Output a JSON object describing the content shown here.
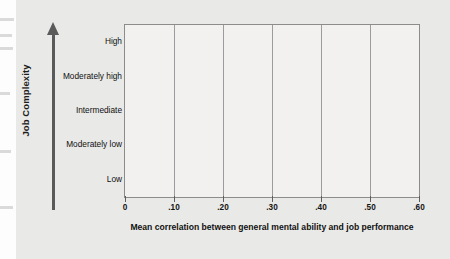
{
  "chart_data": {
    "type": "bar",
    "orientation": "horizontal",
    "title": "",
    "xlabel": "Mean correlation between general mental ability and job performance",
    "ylabel": "Job Complexity",
    "categories": [
      "Low",
      "Moderately low",
      "Intermediate",
      "Moderately high",
      "High"
    ],
    "values": [
      0.23,
      0.4,
      0.51,
      0.56,
      0.58
    ],
    "bar_colors": [
      "#6a6a6a",
      "#2b2b2b",
      "#7b7b7b",
      "#9c9c9c",
      "#6e6e6e"
    ],
    "xlim": [
      0,
      0.6
    ],
    "xticks": [
      0,
      0.1,
      0.2,
      0.3,
      0.4,
      0.5,
      0.6
    ],
    "xticklabels": [
      "0",
      ".10",
      ".20",
      ".30",
      ".40",
      ".50",
      ".60"
    ],
    "grid": true,
    "grid_axis": "x",
    "legend": null,
    "y_axis_arrow": true,
    "background_color": "#e9e9e7",
    "plot_background_color": "#f2f1ef",
    "frame_color": "#8c8c8c"
  }
}
